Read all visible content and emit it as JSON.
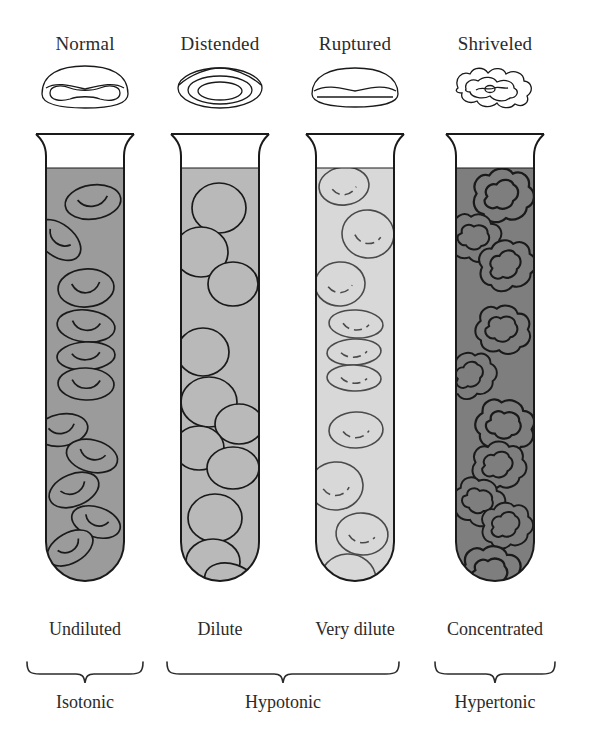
{
  "figure": {
    "background_color": "#ffffff",
    "ink_color": "#1a1a1a"
  },
  "columns": [
    {
      "cell_state": "Normal",
      "cell_icon": "normal-biconcave-cell-icon",
      "solution_label": "Undiluted",
      "tonicity": "Isotonic",
      "fluid_color": "#9b9b9b",
      "cell_fill_color": "#9b9b9b"
    },
    {
      "cell_state": "Distended",
      "cell_icon": "distended-swollen-cell-icon",
      "solution_label": "Dilute",
      "tonicity": "Hypotonic",
      "fluid_color": "#b9b9b9",
      "cell_fill_color": "#b9b9b9"
    },
    {
      "cell_state": "Ruptured",
      "cell_icon": "ruptured-flattened-cell-icon",
      "solution_label": "Very dilute",
      "tonicity": "Hypotonic",
      "fluid_color": "#d8d8d8",
      "cell_fill_color": "#d8d8d8"
    },
    {
      "cell_state": "Shriveled",
      "cell_icon": "shriveled-crenated-cell-icon",
      "solution_label": "Concentrated",
      "tonicity": "Hypertonic",
      "fluid_color": "#7e7e7e",
      "cell_fill_color": "#7e7e7e"
    }
  ],
  "tonicity_groups": [
    {
      "label": "Isotonic",
      "spans": [
        "Undiluted"
      ]
    },
    {
      "label": "Hypotonic",
      "spans": [
        "Dilute",
        "Very dilute"
      ]
    },
    {
      "label": "Hypertonic",
      "spans": [
        "Concentrated"
      ]
    }
  ]
}
